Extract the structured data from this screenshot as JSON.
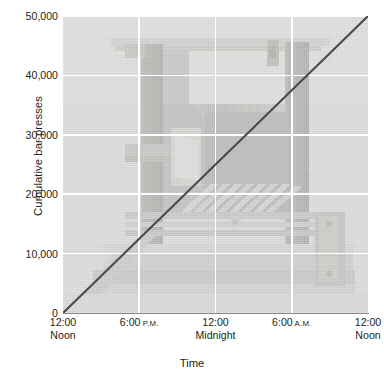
{
  "chart_data": {
    "type": "line",
    "title": "",
    "xlabel": "Time",
    "ylabel": "Cumulative bar presses",
    "ylim": [
      0,
      50000
    ],
    "yticks": [
      0,
      10000,
      20000,
      30000,
      40000,
      50000
    ],
    "ytick_labels": [
      "0",
      "10,000",
      "20,000",
      "30,000",
      "40,000",
      "50,000"
    ],
    "xlim": [
      0,
      24
    ],
    "xticks": [
      0,
      6,
      12,
      18,
      24
    ],
    "xtick_labels": [
      {
        "line1": "12:00",
        "ampm": "",
        "line2": "Noon"
      },
      {
        "line1": "6:00",
        "ampm": "P.M.",
        "line2": ""
      },
      {
        "line1": "12:00",
        "ampm": "",
        "line2": "Midnight"
      },
      {
        "line1": "6:00",
        "ampm": "A.M.",
        "line2": ""
      },
      {
        "line1": "12:00",
        "ampm": "",
        "line2": "Noon"
      }
    ],
    "grid": true,
    "grid_color": "#ffffff",
    "legend": "none",
    "series": [
      {
        "name": "Cumulative bar presses",
        "color": "#4a4a4a",
        "x": [
          0,
          3,
          6,
          9,
          12,
          15,
          18,
          21,
          24
        ],
        "values": [
          0,
          6250,
          12500,
          18750,
          25000,
          31250,
          37500,
          43750,
          50000
        ]
      }
    ],
    "background_image": {
      "description": "faded grayscale photograph of an operant conditioning chamber",
      "opacity_note": "washed-out, low contrast"
    }
  },
  "axis": {
    "y_title": "Cumulative bar presses",
    "x_title": "Time"
  }
}
